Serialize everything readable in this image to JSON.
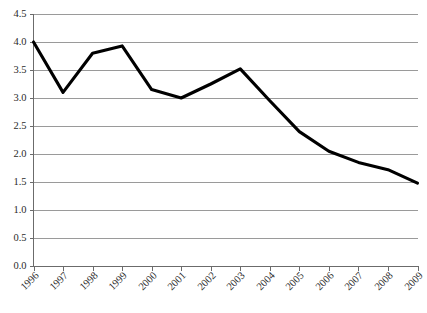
{
  "chart_data": {
    "type": "line",
    "title": "",
    "subtitle": "",
    "xlabel": "",
    "ylabel": "",
    "categories": [
      "1996",
      "1997",
      "1998",
      "1999",
      "2000",
      "2001",
      "2002",
      "2003",
      "2004",
      "2005",
      "2006",
      "2007",
      "2008",
      "2009"
    ],
    "values": [
      4.0,
      3.1,
      3.8,
      3.93,
      3.15,
      3.0,
      3.25,
      3.52,
      2.95,
      2.4,
      2.05,
      1.85,
      1.72,
      1.48
    ],
    "series": [
      {
        "name": "",
        "values": [
          4.0,
          3.1,
          3.8,
          3.93,
          3.15,
          3.0,
          3.25,
          3.52,
          2.95,
          2.4,
          2.05,
          1.85,
          1.72,
          1.48
        ]
      }
    ],
    "ylim": [
      0.0,
      4.5
    ],
    "ytick_labels": [
      "0.0",
      "0.5",
      "1.0",
      "1.5",
      "2.0",
      "2.5",
      "3.0",
      "3.5",
      "4.0",
      "4.5"
    ],
    "ytick_values": [
      0.0,
      0.5,
      1.0,
      1.5,
      2.0,
      2.5,
      3.0,
      3.5,
      4.0,
      4.5
    ],
    "xtick_labels": [
      "1996",
      "1997",
      "1998",
      "1999",
      "2000",
      "2001",
      "2002",
      "2003",
      "2004",
      "2005",
      "2006",
      "2007",
      "2008",
      "2009"
    ],
    "xtick_rotation": 45,
    "grid": true,
    "grid_axis": "y",
    "legend": false,
    "legend_position": "none",
    "annotations": [],
    "line_color": "#000000",
    "grid_color": "#9a9a9a",
    "axis_color": "#6b6b6b",
    "background_color": "#ffffff",
    "markers": false
  }
}
